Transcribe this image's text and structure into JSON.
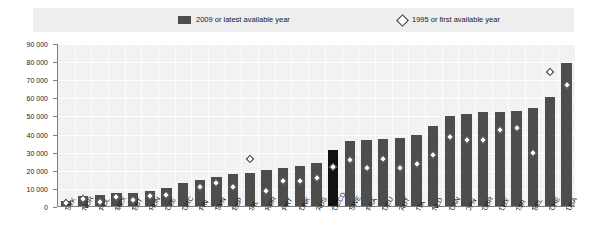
{
  "legend": {
    "series_bar_label": "2009 or latest available year",
    "series_diamond_label": "1995 or first available year",
    "bar_color": "#4d4d4d",
    "diamond_color": "#ffffff",
    "diamond_border_color": "#2b2b2b",
    "highlight_color": "#111111"
  },
  "axis": {
    "y_ticks": [
      "90 000",
      "80 000",
      "70 000",
      "60 000",
      "50 000",
      "40 000",
      "30 000",
      "20 000",
      "10 000",
      "0"
    ]
  },
  "chart_data": {
    "type": "bar",
    "title": "",
    "subtitle": "",
    "xlabel": "",
    "ylabel": "",
    "ylim": [
      0,
      90000
    ],
    "ytick_values": [
      0,
      10000,
      20000,
      30000,
      40000,
      50000,
      60000,
      70000,
      80000,
      90000
    ],
    "grid": true,
    "legend_position": "top",
    "highlight_category": "OECD",
    "categories": [
      "SVK",
      "NOR",
      "POL",
      "MEX",
      "EST",
      "HUN",
      "CZE",
      "GRC",
      "FIN",
      "SVN",
      "ESP",
      "IRL",
      "KOR",
      "PRT",
      "DNK",
      "AUS",
      "OECD",
      "SWE",
      "FRA",
      "DEU",
      "AUT",
      "ITA",
      "NLD",
      "CAN",
      "JPN",
      "GBR",
      "LUX",
      "ISR",
      "BEL",
      "CHE",
      "USA"
    ],
    "series": [
      {
        "name": "2009 or latest available year",
        "type": "bar",
        "values": [
          3500,
          6200,
          6500,
          7500,
          8000,
          8800,
          10500,
          13500,
          15000,
          16500,
          18000,
          19000,
          20500,
          21500,
          22500,
          24500,
          31500,
          36500,
          37000,
          37500,
          38000,
          39500,
          44500,
          50000,
          51500,
          52500,
          52500,
          53000,
          54500,
          60500,
          79500
        ]
      },
      {
        "name": "1995 or first available year",
        "type": "scatter",
        "marker": "diamond",
        "values": [
          2500,
          4500,
          3200,
          5800,
          4200,
          6200,
          6800,
          null,
          11000,
          13500,
          11500,
          27000,
          9000,
          14500,
          14500,
          16500,
          22500,
          26000,
          21500,
          26500,
          22000,
          24000,
          29000,
          39000,
          37000,
          37500,
          42500,
          44000,
          30000,
          74500,
          67500
        ]
      }
    ]
  }
}
